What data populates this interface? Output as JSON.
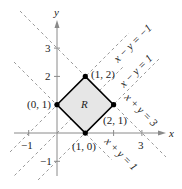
{
  "axes": {
    "x_label": "x",
    "y_label": "y",
    "x_ticks": [
      {
        "value": -1,
        "label": "−1"
      },
      {
        "value": 1,
        "label": ""
      },
      {
        "value": 2,
        "label": ""
      },
      {
        "value": 3,
        "label": "3"
      }
    ],
    "y_ticks": [
      {
        "value": -1,
        "label": "−1"
      },
      {
        "value": 1,
        "label": ""
      },
      {
        "value": 2,
        "label": "2"
      },
      {
        "value": 3,
        "label": "3"
      }
    ]
  },
  "region": {
    "label": "R",
    "fill": "#e6e6e6",
    "edge": "#000000"
  },
  "vertices": [
    {
      "label": "(0, 1)",
      "x": 0,
      "y": 1
    },
    {
      "label": "(1, 2)",
      "x": 1,
      "y": 2
    },
    {
      "label": "(2, 1)",
      "x": 2,
      "y": 1
    },
    {
      "label": "(1, 0)",
      "x": 1,
      "y": 0
    }
  ],
  "lines": [
    {
      "label": "x − y = −1"
    },
    {
      "label": "x − y = 1"
    },
    {
      "label": "x + y = 3"
    },
    {
      "label": "x + y = 1"
    }
  ],
  "colors": {
    "axis": "#888888",
    "dashed": "#999999",
    "region": "#e6e6e6",
    "edge": "#000000"
  }
}
